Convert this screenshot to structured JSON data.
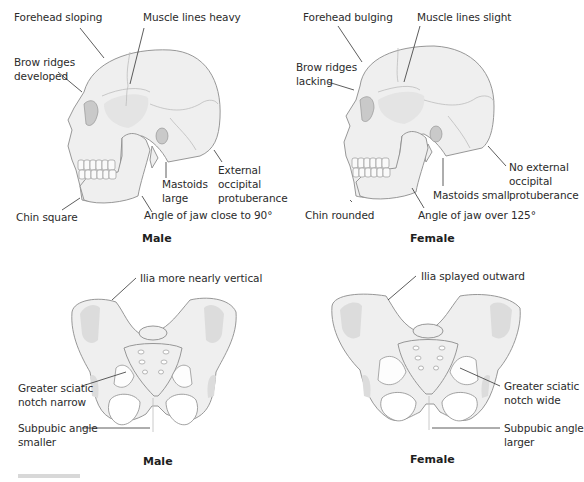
{
  "figure": {
    "panels": {
      "male_skull": {
        "caption": "Male",
        "labels": {
          "forehead": "Forehead sloping",
          "muscle": "Muscle lines heavy",
          "brow_1": "Brow ridges",
          "brow_2": "developed",
          "occipital_1": "External",
          "occipital_2": "occipital",
          "occipital_3": "protuberance",
          "mastoid_1": "Mastoids",
          "mastoid_2": "large",
          "chin": "Chin square",
          "jaw": "Angle of jaw close to 90°"
        }
      },
      "female_skull": {
        "caption": "Female",
        "labels": {
          "forehead": "Forehead bulging",
          "muscle": "Muscle lines slight",
          "brow_1": "Brow ridges",
          "brow_2": "lacking",
          "occipital_1": "No external",
          "occipital_2": "occipital",
          "occipital_3": "protuberance",
          "mastoid": "Mastoids small",
          "chin": "Chin rounded",
          "jaw": "Angle of jaw over 125°"
        }
      },
      "male_pelvis": {
        "caption": "Male",
        "labels": {
          "ilia": "Ilia more nearly vertical",
          "sciatic_1": "Greater sciatic",
          "sciatic_2": "notch narrow",
          "subpubic_1": "Subpubic angle",
          "subpubic_2": "smaller"
        }
      },
      "female_pelvis": {
        "caption": "Female",
        "labels": {
          "ilia": "Ilia splayed outward",
          "sciatic_1": "Greater sciatic",
          "sciatic_2": "notch wide",
          "subpubic_1": "Subpubic angle",
          "subpubic_2": "larger"
        }
      }
    },
    "colors": {
      "bone_fill": "#efefef",
      "bone_shade": "#dcdcdc",
      "outline": "#8c8c8c",
      "text": "#2b2b2b"
    }
  }
}
